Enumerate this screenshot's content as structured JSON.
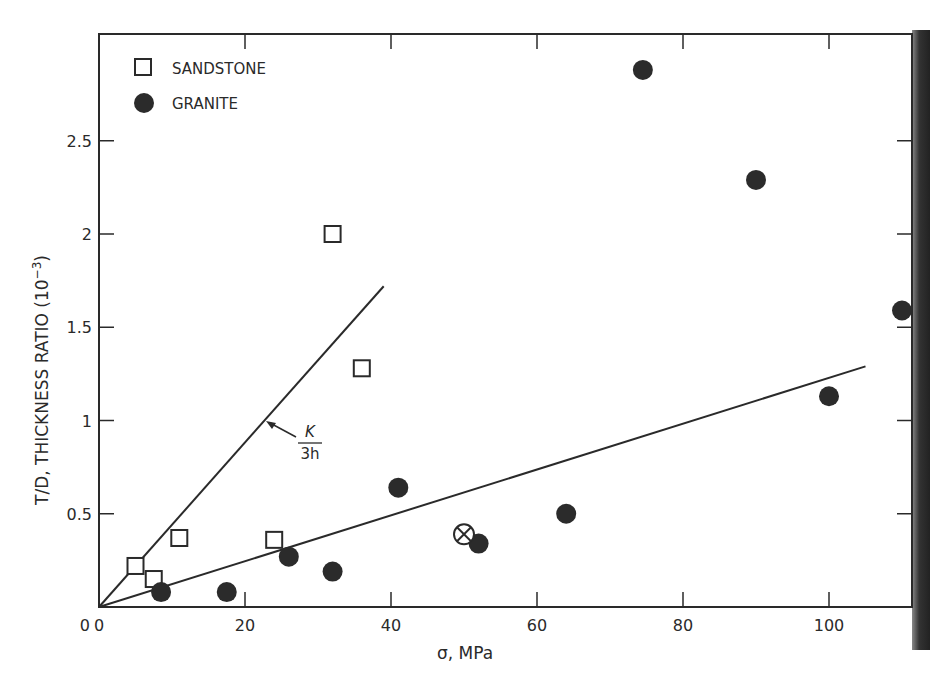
{
  "chart_data": {
    "type": "scatter",
    "title": "",
    "xlabel": "σ, MPa",
    "ylabel": "T/D, THICKNESS RATIO (10⁻³)",
    "xlim": [
      0,
      112
    ],
    "ylim": [
      0,
      3.0
    ],
    "x_ticks": [
      0,
      20,
      40,
      60,
      80,
      100
    ],
    "x_tick_labels": [
      "0",
      "20",
      "40",
      "60",
      "80",
      "100"
    ],
    "y_ticks": [
      0,
      0.5,
      1,
      1.5,
      2,
      2.5
    ],
    "y_tick_labels": [
      "0",
      "0.5",
      "1",
      "1.5",
      "2",
      "2.5"
    ],
    "grid": false,
    "legend_position": "upper-left",
    "series": [
      {
        "name": "SANDSTONE",
        "marker": "open-square",
        "points": [
          [
            5,
            0.22
          ],
          [
            7.5,
            0.15
          ],
          [
            11,
            0.37
          ],
          [
            24,
            0.36
          ],
          [
            32,
            2.0
          ],
          [
            36,
            1.28
          ]
        ]
      },
      {
        "name": "GRANITE",
        "marker": "filled-circle",
        "points": [
          [
            8.5,
            0.08
          ],
          [
            17.5,
            0.08
          ],
          [
            26,
            0.27
          ],
          [
            32,
            0.19
          ],
          [
            41,
            0.64
          ],
          [
            52,
            0.34
          ],
          [
            64,
            0.5
          ],
          [
            74.5,
            2.88
          ],
          [
            90,
            2.29
          ],
          [
            100,
            1.13
          ],
          [
            110,
            1.59
          ]
        ]
      },
      {
        "name": "special",
        "marker": "circled-x",
        "points": [
          [
            50,
            0.39
          ]
        ]
      }
    ],
    "lines": [
      {
        "name": "K/3h",
        "from": [
          0,
          0
        ],
        "to": [
          39,
          1.72
        ]
      },
      {
        "name": "granite-fit",
        "from": [
          0,
          0
        ],
        "to": [
          105,
          1.29
        ]
      }
    ],
    "annotations": [
      {
        "text_numerator": "K",
        "text_denominator": "3h",
        "arrow_to": [
          23,
          1.0
        ]
      }
    ]
  },
  "legend": {
    "sandstone": "SANDSTONE",
    "granite": "GRANITE"
  },
  "axes": {
    "xlabel": "σ, MPa",
    "ylabel_main": "T/D, THICKNESS RATIO (10",
    "ylabel_exp": "−3",
    "ylabel_close": ")"
  },
  "annotation": {
    "numerator": "K",
    "denominator": "3h"
  },
  "colors": {
    "ink": "#2a2a2a",
    "marker_fill": "#2b2b2b",
    "background": "#ffffff"
  }
}
